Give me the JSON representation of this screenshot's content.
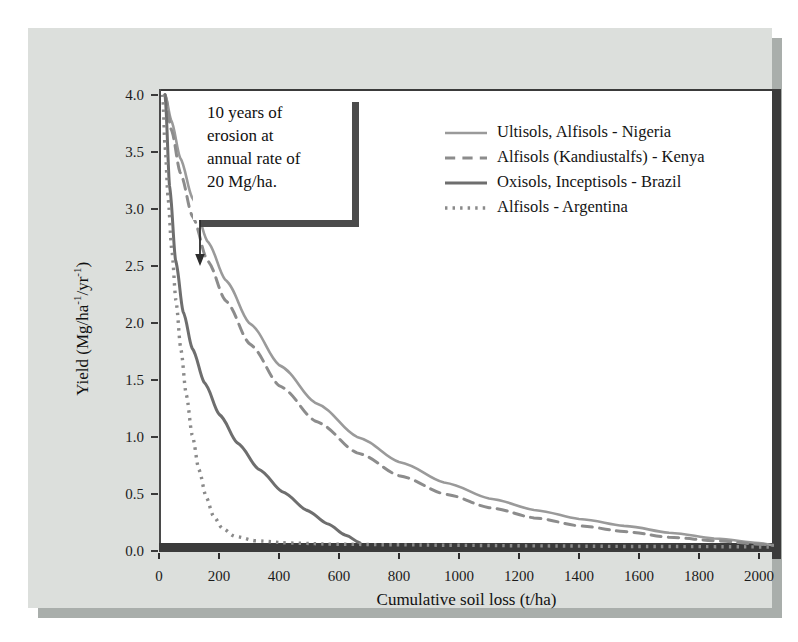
{
  "figure": {
    "background_color": "#dcdfdc",
    "plot_background_color": "#ffffff",
    "axis_color": "#3b3b3b"
  },
  "annotation": {
    "lines": [
      "10 years of",
      "erosion at",
      "annual rate of",
      "20 Mg/ha."
    ],
    "arrow_name": "annotation-arrow"
  },
  "chart_data": {
    "type": "line",
    "title": "",
    "xlabel": "Cumulative soil loss (t/ha)",
    "ylabel": "Yield (Mg/ha⁻¹/yr⁻¹)",
    "ylabel_parts": {
      "prefix": "Yield (Mg/ha",
      "sup1": "-1",
      "middle": "/yr",
      "sup2": "-1",
      "suffix": ")"
    },
    "xlim": [
      0,
      2050
    ],
    "ylim": [
      0,
      4.05
    ],
    "grid": false,
    "legend_position": "top-right",
    "xticks": [
      0,
      200,
      400,
      600,
      800,
      1000,
      1200,
      1400,
      1600,
      1800,
      2000
    ],
    "xtick_labels": [
      "0",
      "200",
      "400",
      "600",
      "800",
      "1000",
      "1200",
      "1400",
      "1600",
      "1800",
      "2000"
    ],
    "yticks": [
      0.0,
      0.5,
      1.0,
      1.5,
      2.0,
      2.5,
      3.0,
      3.5,
      4.0
    ],
    "ytick_labels": [
      "0.0",
      "0.5",
      "1.0",
      "1.5",
      "2.0",
      "2.5",
      "3.0",
      "3.5",
      "4.0"
    ],
    "series": [
      {
        "name": "Ultisols, Alfisols - Nigeria",
        "style": "solid",
        "color": "#9a9a9a",
        "width": 2.6,
        "x": [
          20,
          40,
          70,
          110,
          160,
          220,
          300,
          400,
          520,
          660,
          800,
          950,
          1100,
          1250,
          1400,
          1550,
          1700,
          1850,
          2000,
          2050
        ],
        "y": [
          4.0,
          3.78,
          3.45,
          3.1,
          2.72,
          2.38,
          2.0,
          1.63,
          1.3,
          1.0,
          0.78,
          0.6,
          0.46,
          0.36,
          0.28,
          0.22,
          0.16,
          0.11,
          0.07,
          0.05
        ]
      },
      {
        "name": "Alfisols (Kandiustalfs) - Kenya",
        "style": "dashed",
        "color": "#8c8c8c",
        "width": 3.0,
        "x": [
          20,
          40,
          70,
          110,
          160,
          220,
          300,
          400,
          520,
          660,
          800,
          950,
          1100,
          1250,
          1400,
          1550,
          1700,
          1850,
          2000,
          2050
        ],
        "y": [
          4.0,
          3.7,
          3.32,
          2.94,
          2.55,
          2.2,
          1.82,
          1.45,
          1.14,
          0.86,
          0.66,
          0.5,
          0.38,
          0.29,
          0.22,
          0.17,
          0.12,
          0.09,
          0.06,
          0.05
        ]
      },
      {
        "name": "Oxisols, Inceptisols - Brazil",
        "style": "solid",
        "color": "#6e6e6e",
        "width": 3.0,
        "x": [
          20,
          35,
          55,
          80,
          110,
          150,
          200,
          260,
          330,
          410,
          490,
          560,
          620,
          670
        ],
        "y": [
          4.0,
          3.2,
          2.55,
          2.1,
          1.78,
          1.48,
          1.2,
          0.95,
          0.72,
          0.52,
          0.36,
          0.24,
          0.14,
          0.07
        ]
      },
      {
        "name": "Alfisols - Argentina",
        "style": "dotted",
        "color": "#8a8a8a",
        "width": 3.4,
        "x": [
          12,
          20,
          30,
          42,
          56,
          72,
          90,
          110,
          132,
          156,
          180,
          210,
          250,
          320,
          430,
          580,
          760,
          980,
          1250,
          1550,
          1850,
          2050
        ],
        "y": [
          4.0,
          3.55,
          3.1,
          2.65,
          2.2,
          1.78,
          1.38,
          1.02,
          0.72,
          0.48,
          0.31,
          0.2,
          0.13,
          0.09,
          0.07,
          0.06,
          0.055,
          0.05,
          0.045,
          0.04,
          0.038,
          0.035
        ]
      }
    ]
  }
}
